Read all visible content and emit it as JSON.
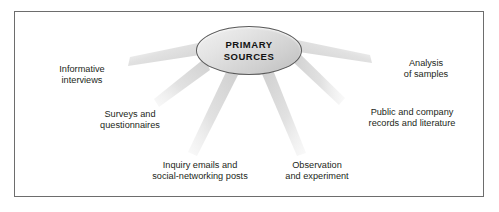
{
  "figure": {
    "type": "radial-spoke-diagram",
    "border_color": "#6d6d6d",
    "background_color": "#ffffff",
    "ray_color": "#d8d8d8",
    "center": {
      "shape": "ellipse",
      "fill_top": "#f2f2f2",
      "fill_bottom": "#bdbdbd",
      "stroke": "#5a5a5a",
      "lines": [
        "PRIMARY",
        "SOURCES"
      ]
    },
    "spokes": [
      {
        "id": "informative-interviews",
        "lines": [
          "Informative",
          "interviews"
        ],
        "direction": "upper-left"
      },
      {
        "id": "surveys-questionnaires",
        "lines": [
          "Surveys and",
          "questionnaires"
        ],
        "direction": "left"
      },
      {
        "id": "inquiry-emails",
        "lines": [
          "Inquiry emails and",
          "social-networking posts"
        ],
        "direction": "lower-left"
      },
      {
        "id": "observation-experiment",
        "lines": [
          "Observation",
          "and experiment"
        ],
        "direction": "lower-right"
      },
      {
        "id": "public-company-records",
        "lines": [
          "Public and company",
          "records and literature"
        ],
        "direction": "right"
      },
      {
        "id": "analysis-of-samples",
        "lines": [
          "Analysis",
          "of samples"
        ],
        "direction": "upper-right"
      }
    ]
  }
}
